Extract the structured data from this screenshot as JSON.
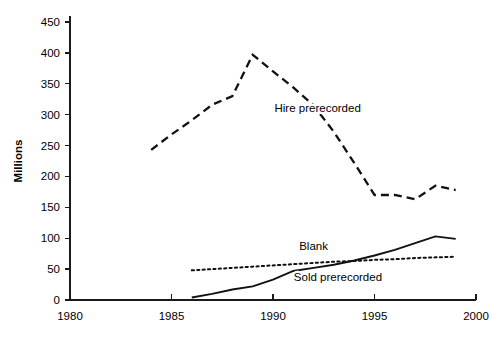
{
  "chart_data": {
    "type": "line",
    "title": "",
    "xlabel": "",
    "ylabel": "Millions",
    "xlim": [
      1980,
      2000
    ],
    "ylim": [
      0,
      450
    ],
    "grid": false,
    "legend": "inline-labels",
    "x_ticks": [
      "1980",
      "1985",
      "1990",
      "1995",
      "2000"
    ],
    "y_ticks": [
      "0",
      "50",
      "100",
      "150",
      "200",
      "250",
      "300",
      "350",
      "400",
      "450"
    ],
    "series": [
      {
        "name": "Hire prerecorded",
        "style": "dashed",
        "label_x": 1992.2,
        "label_y": 310,
        "x": [
          1984,
          1985,
          1986,
          1987,
          1988,
          1989,
          1990,
          1991,
          1992,
          1993,
          1994,
          1995,
          1996,
          1997,
          1998,
          1999
        ],
        "values": [
          243,
          268,
          291,
          316,
          330,
          397,
          370,
          344,
          315,
          272,
          222,
          170,
          170,
          163,
          185,
          178
        ]
      },
      {
        "name": "Blank",
        "style": "dotted",
        "label_x": 1992.0,
        "label_y": 88,
        "x": [
          1986,
          1987,
          1988,
          1989,
          1990,
          1991,
          1992,
          1993,
          1994,
          1995,
          1996,
          1997,
          1998,
          1999
        ],
        "values": [
          48,
          50,
          52,
          54,
          56,
          58,
          60,
          62,
          63,
          65,
          66,
          68,
          69,
          70
        ]
      },
      {
        "name": "Sold prerecorded",
        "style": "solid",
        "label_x": 1993.2,
        "label_y": 38,
        "x": [
          1986,
          1987,
          1988,
          1989,
          1990,
          1991,
          1992,
          1993,
          1994,
          1995,
          1996,
          1997,
          1998,
          1999
        ],
        "values": [
          4,
          10,
          17,
          22,
          33,
          47,
          52,
          57,
          64,
          72,
          81,
          92,
          103,
          99
        ]
      }
    ]
  }
}
